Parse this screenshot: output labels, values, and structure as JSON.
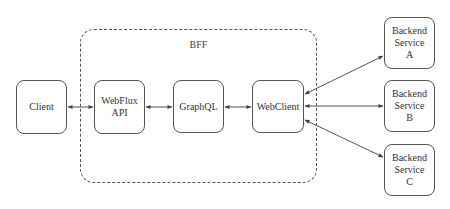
{
  "diagram": {
    "group": {
      "label": "BFF"
    },
    "nodes": {
      "client": "Client",
      "webflux_api": "WebFlux\nAPI",
      "graphql": "GraphQL",
      "webclient": "WebClient",
      "backend_a": "Backend\nService\nA",
      "backend_b": "Backend\nService\nB",
      "backend_c": "Backend\nService\nC"
    },
    "edges": [
      {
        "from": "Client",
        "to": "WebFlux API",
        "type": "bidirectional"
      },
      {
        "from": "WebFlux API",
        "to": "GraphQL",
        "type": "bidirectional"
      },
      {
        "from": "GraphQL",
        "to": "WebClient",
        "type": "bidirectional"
      },
      {
        "from": "WebClient",
        "to": "Backend Service A",
        "type": "bidirectional"
      },
      {
        "from": "WebClient",
        "to": "Backend Service B",
        "type": "bidirectional"
      },
      {
        "from": "WebClient",
        "to": "Backend Service C",
        "type": "bidirectional"
      }
    ],
    "colors": {
      "stroke": "#555555",
      "text": "#333333",
      "background": "#ffffff"
    }
  }
}
